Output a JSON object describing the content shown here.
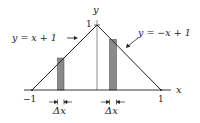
{
  "figure": {
    "axis_labels": {
      "x": "x",
      "y": "y"
    },
    "tick_labels": {
      "x_neg": "−1",
      "x_pos": "1",
      "y_top": "1"
    },
    "curves": [
      {
        "label": "y = x + 1",
        "side": "left"
      },
      {
        "label": "y = −x + 1",
        "side": "right"
      }
    ],
    "strips": [
      {
        "label": "Δx",
        "side": "left"
      },
      {
        "label": "Δx",
        "side": "right"
      }
    ],
    "colors": {
      "line": "#222222",
      "strip_fill": "#8a8a8a",
      "background": "#ffffff"
    }
  }
}
